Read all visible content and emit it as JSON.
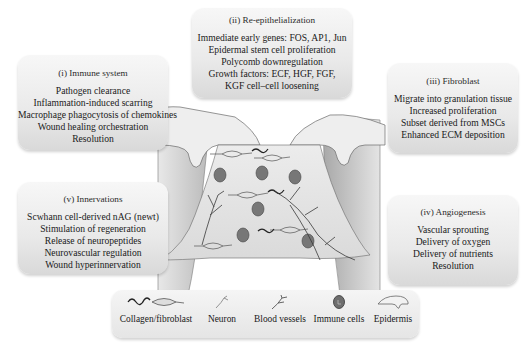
{
  "boxes": {
    "immune": {
      "title": "(i) Immune system",
      "lines": [
        "Pathogen clearance",
        "Inflammation-induced scarring",
        "Macrophage phagocytosis of chemokines",
        "Wound healing orchestration",
        "Resolution"
      ]
    },
    "reepithelialization": {
      "title": "(ii) Re-epithelialization",
      "lines": [
        "Immediate early genes: FOS, AP1, Jun",
        "Epidermal stem cell proliferation",
        "Polycomb downregulation",
        "Growth factors: ECF, HGF, FGF,",
        "KGF cell–cell loosening"
      ]
    },
    "fibroblast": {
      "title": "(iii) Fibroblast",
      "lines": [
        "Migrate into granulation tissue",
        "Increased proliferation",
        "Subset derived from MSCs",
        "Enhanced ECM deposition"
      ]
    },
    "angiogenesis": {
      "title": "(iv) Angiogenesis",
      "lines": [
        "Vascular sprouting",
        "Delivery of oxygen",
        "Delivery of nutrients",
        "Resolution"
      ]
    },
    "innervations": {
      "title": "(v) Innervations",
      "lines": [
        "Scwhann cell-derived nAG (newt)",
        "Stimulation of regeneration",
        "Release of neuropeptides",
        "Neurovascular regulation",
        "Wound hyperinnervation"
      ]
    }
  },
  "legend": {
    "items": [
      {
        "label": "Collagen/fibroblast",
        "icon": "collagen-fibroblast-icon"
      },
      {
        "label": "Neuron",
        "icon": "neuron-icon"
      },
      {
        "label": "Blood vessels",
        "icon": "blood-vessel-icon"
      },
      {
        "label": "Immune cells",
        "icon": "immune-cell-icon"
      },
      {
        "label": "Epidermis",
        "icon": "epidermis-icon"
      }
    ]
  },
  "colors": {
    "box_light": "#f7f7f7",
    "box_dark": "#d9d9d9",
    "tissue_gray": "#9a9a9a",
    "wound_bed": "#e2e2e2",
    "immune_cell": "#6e6e6e",
    "outline": "#4a4a4a"
  }
}
